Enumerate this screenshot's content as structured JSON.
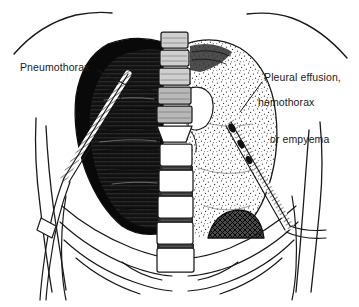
{
  "figure": {
    "background_color": "#ffffff",
    "ink_color": "#1a1a1a"
  },
  "labels": {
    "left": {
      "name": "pneumothorax",
      "text": "Pneumothorax",
      "points_to": "left-hemithorax-dark-pleural-space"
    },
    "right": {
      "name": "pleural-effusion",
      "line1": "Pleural effusion,",
      "line2": "hemothorax",
      "line3": "or empyema",
      "points_to": "right-hemithorax-stippled-fluid"
    }
  },
  "anatomy": {
    "spine_segments": 11,
    "left_side": {
      "fill": "dark-hatched",
      "contents": "collapsed lung and air in pleural space",
      "tube": "chest tube entering upper lateral chest wall"
    },
    "right_side": {
      "fill": "stippled",
      "contents": "fluid in pleural space",
      "tube": "chest tube entering lateral chest wall",
      "diaphragm_dome": "cross-hatched dome at lung base"
    },
    "ribs_visible": true,
    "clavicles_visible": true,
    "heart_shadow": true
  }
}
